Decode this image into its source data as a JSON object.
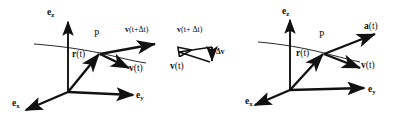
{
  "figure": {
    "stroke_color": "#111111",
    "background_color": "#ffffff",
    "panels": [
      {
        "id": "left-panel",
        "name": "velocity-panel",
        "axes": {
          "z": {
            "label_vec": "e",
            "label_sub": "z"
          },
          "y": {
            "label_vec": "e",
            "label_sub": "y"
          },
          "x": {
            "label_vec": "e",
            "label_sub": "x"
          }
        },
        "point_label": "P",
        "position_vector": {
          "label_vec": "r",
          "label_arg": "(t)"
        },
        "vectors": [
          {
            "name": "velocity-t-plus-dt",
            "label_vec": "v",
            "label_arg": "(t+Δt)"
          },
          {
            "name": "velocity-t",
            "label_vec": "v",
            "label_arg": "(t)"
          }
        ]
      },
      {
        "id": "middle-panel",
        "name": "velocity-difference-triangle",
        "vectors": [
          {
            "name": "velocity-t-plus-dt",
            "label_vec": "v",
            "label_arg": "(t+ Δt)"
          },
          {
            "name": "velocity-t",
            "label_vec": "v",
            "label_arg": "(t)"
          },
          {
            "name": "delta-v",
            "label_vec": "Δv",
            "label_arg": ""
          }
        ]
      },
      {
        "id": "right-panel",
        "name": "acceleration-panel",
        "axes": {
          "z": {
            "label_vec": "e",
            "label_sub": "z"
          },
          "y": {
            "label_vec": "e",
            "label_sub": "y"
          },
          "x": {
            "label_vec": "e",
            "label_sub": "x"
          }
        },
        "point_label": "P",
        "position_vector": {
          "label_vec": "r",
          "label_arg": "(t)"
        },
        "vectors": [
          {
            "name": "acceleration-t",
            "label_vec": "a",
            "label_arg": "(t)"
          },
          {
            "name": "velocity-t",
            "label_vec": "v",
            "label_arg": "(t)"
          }
        ]
      }
    ],
    "labels": {
      "left_ez_vec": "e",
      "left_ez_sub": "z",
      "left_ey_vec": "e",
      "left_ey_sub": "y",
      "left_ex_vec": "e",
      "left_ex_sub": "x",
      "left_P": "P",
      "left_r_vec": "r",
      "left_r_arg": "(t)",
      "left_vdt_vec": "v",
      "left_vdt_arg": "(t+Δt)",
      "left_v_vec": "v",
      "left_v_arg": "(t)",
      "mid_vdt_vec": "v",
      "mid_vdt_arg": "(t+ Δt)",
      "mid_v_vec": "v",
      "mid_v_arg": "(t)",
      "mid_dv": "Δv",
      "right_ez_vec": "e",
      "right_ez_sub": "z",
      "right_ey_vec": "e",
      "right_ey_sub": "y",
      "right_ex_vec": "e",
      "right_ex_sub": "x",
      "right_P": "P",
      "right_r_vec": "r",
      "right_r_arg": "(t)",
      "right_a_vec": "a",
      "right_a_arg": "(t)",
      "right_v_vec": "v",
      "right_v_arg": "(t)"
    }
  }
}
